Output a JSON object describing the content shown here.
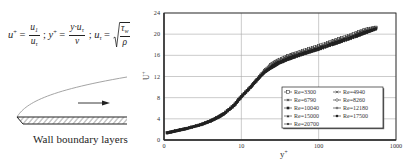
{
  "left_panel": {
    "formula": {
      "t1_base": "u",
      "t1_sup": "+",
      "eq": "=",
      "f1_num_base": "u",
      "f1_num_sub": "1",
      "f1_den_base": "u",
      "f1_den_sub": "τ",
      "sep": ";",
      "t2_base": "y",
      "t2_sup": "+",
      "f2_num_base": "y·u",
      "f2_num_sub": "τ",
      "f2_den": "ν",
      "t3_base": "u",
      "t3_sub": "τ",
      "f3_num_base": "τ",
      "f3_num_sub": "w",
      "f3_den": "ρ"
    },
    "caption": "Wall boundary layers",
    "diagram_icons": [
      "boundary-layer-profile-icon",
      "flow-direction-arrow-icon",
      "hatched-wall-icon"
    ]
  },
  "chart_data": {
    "type": "scatter",
    "title": "",
    "xlabel": "y+",
    "ylabel": "U+",
    "xscale": "log",
    "xlim": [
      1,
      1000
    ],
    "ylim": [
      0,
      24
    ],
    "xticks": [
      1,
      10,
      100,
      1000
    ],
    "xtick_labels": [
      "0",
      "10",
      "100",
      "1000"
    ],
    "yticks": [
      0,
      4,
      8,
      12,
      16,
      20,
      24
    ],
    "ytick_labels": [
      "0",
      "4",
      "8",
      "12",
      "16",
      "20",
      "24"
    ],
    "grid": true,
    "legend_position": "lower right",
    "legend": {
      "columns": [
        [
          "Re=3300",
          "Re=6790",
          "Re=10040",
          "Re=15000",
          "Re=20700"
        ],
        [
          "Re=4940",
          "Re=8260",
          "Re=12180",
          "Re=17500"
        ]
      ]
    },
    "x": [
      1.1,
      1.5,
      2,
      3,
      4,
      5,
      6,
      8,
      10,
      13,
      16,
      20,
      25,
      30,
      40,
      50,
      70,
      100,
      150,
      200,
      300,
      400,
      550
    ],
    "series": [
      {
        "name": "Re=3300",
        "marker": "open-square",
        "values": [
          1.35,
          1.8,
          2.2,
          2.9,
          3.6,
          4.3,
          5.0,
          6.5,
          8.2,
          9.9,
          11.4,
          13.1,
          14.4,
          15.1,
          15.9,
          16.4,
          17.1,
          17.8,
          18.7,
          19.3,
          20.2,
          20.9,
          21.3
        ]
      },
      {
        "name": "Re=4940",
        "marker": "x-cross",
        "values": [
          1.35,
          1.8,
          2.2,
          2.9,
          3.6,
          4.3,
          5.0,
          6.5,
          8.2,
          9.9,
          11.4,
          13.0,
          14.3,
          15.0,
          15.8,
          16.3,
          17.0,
          17.7,
          18.6,
          19.2,
          20.1,
          20.8,
          21.3
        ]
      },
      {
        "name": "Re=6790",
        "marker": "asterisk",
        "values": [
          1.35,
          1.8,
          2.2,
          2.9,
          3.6,
          4.3,
          5.0,
          6.5,
          8.2,
          9.9,
          11.4,
          13.0,
          14.2,
          14.9,
          15.7,
          16.2,
          16.9,
          17.6,
          18.5,
          19.1,
          20.0,
          20.7,
          21.2
        ]
      },
      {
        "name": "Re=8260",
        "marker": "open-circle",
        "values": [
          1.35,
          1.8,
          2.2,
          2.9,
          3.6,
          4.3,
          5.0,
          6.5,
          8.2,
          9.9,
          11.4,
          12.9,
          14.1,
          14.8,
          15.6,
          16.1,
          16.8,
          17.5,
          18.4,
          19.0,
          19.9,
          20.6,
          21.2
        ]
      },
      {
        "name": "Re=10040",
        "marker": "filled-square",
        "values": [
          1.35,
          1.8,
          2.2,
          2.9,
          3.6,
          4.3,
          5.0,
          6.5,
          8.2,
          9.9,
          11.4,
          12.9,
          14.0,
          14.7,
          15.5,
          16.0,
          16.7,
          17.4,
          18.3,
          18.9,
          19.8,
          20.5,
          21.1
        ]
      },
      {
        "name": "Re=12180",
        "marker": "plus",
        "values": [
          1.35,
          1.8,
          2.2,
          2.9,
          3.6,
          4.3,
          5.0,
          6.5,
          8.2,
          9.9,
          11.4,
          12.9,
          13.9,
          14.6,
          15.4,
          15.9,
          16.6,
          17.3,
          18.2,
          18.8,
          19.7,
          20.4,
          21.0
        ]
      },
      {
        "name": "Re=15000",
        "marker": "filled-triangle",
        "values": [
          1.35,
          1.8,
          2.2,
          2.9,
          3.6,
          4.3,
          5.0,
          6.5,
          8.2,
          9.9,
          11.4,
          12.8,
          13.8,
          14.5,
          15.3,
          15.8,
          16.5,
          17.2,
          18.1,
          18.7,
          19.6,
          20.3,
          21.0
        ]
      },
      {
        "name": "Re=17500",
        "marker": "filled-circle",
        "values": [
          1.35,
          1.8,
          2.2,
          2.9,
          3.6,
          4.3,
          5.0,
          6.5,
          8.2,
          9.9,
          11.4,
          12.8,
          13.7,
          14.4,
          15.2,
          15.7,
          16.4,
          17.1,
          18.0,
          18.6,
          19.5,
          20.2,
          20.9
        ]
      },
      {
        "name": "Re=20700",
        "marker": "filled-diamond",
        "values": [
          1.35,
          1.8,
          2.2,
          2.9,
          3.6,
          4.3,
          5.0,
          6.5,
          8.2,
          9.9,
          11.4,
          12.7,
          13.6,
          14.3,
          15.1,
          15.6,
          16.3,
          17.0,
          17.9,
          18.5,
          19.4,
          20.1,
          20.9
        ]
      }
    ],
    "colors": {
      "marker": "#222222",
      "grid": "#a8a8a8",
      "frame": "#2a2a2a",
      "legend_border": "#222222"
    }
  }
}
